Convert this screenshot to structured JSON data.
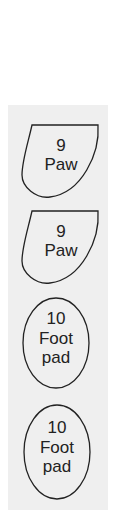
{
  "panel": {
    "background": "#efefef"
  },
  "stamps": [
    {
      "shape": "paw",
      "number": "9",
      "name_lines": [
        "Paw"
      ]
    },
    {
      "shape": "paw",
      "number": "9",
      "name_lines": [
        "Paw"
      ]
    },
    {
      "shape": "foot-pad",
      "number": "10",
      "name_lines": [
        "Foot",
        "pad"
      ]
    },
    {
      "shape": "foot-pad",
      "number": "10",
      "name_lines": [
        "Foot",
        "pad"
      ]
    }
  ],
  "colors": {
    "stroke": "#222222",
    "text": "#222222"
  }
}
